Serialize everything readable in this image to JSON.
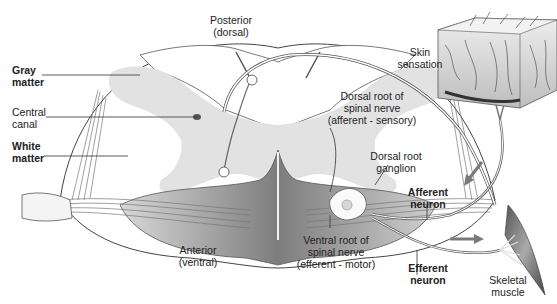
{
  "diagram": {
    "labels": {
      "posterior": [
        "Posterior",
        "(dorsal)"
      ],
      "gray_matter": [
        "Gray",
        "matter"
      ],
      "central_canal": [
        "Central",
        "canal"
      ],
      "white_matter": [
        "White",
        "matter"
      ],
      "skin_sensation": [
        "Skin",
        "sensation"
      ],
      "dorsal_root": [
        "Dorsal root of",
        "spinal nerve",
        "(afferent - sensory)"
      ],
      "dorsal_root_ganglion": [
        "Dorsal root",
        "ganglion"
      ],
      "afferent_neuron": [
        "Afferent",
        "neuron"
      ],
      "anterior": [
        "Anterior",
        "(ventral)"
      ],
      "ventral_root": [
        "Ventral root of",
        "spinal nerve",
        "(efferent - motor)"
      ],
      "efferent_neuron": [
        "Efferent",
        "neuron"
      ],
      "skeletal_muscle": [
        "Skeletal",
        "muscle"
      ]
    },
    "colors": {
      "gray_matter": "#e2e2e2",
      "white_matter": "#ffffff",
      "nerve_dark": "#8a8a8a",
      "outline": "#333333",
      "arrow": "#7a7a7a"
    }
  }
}
